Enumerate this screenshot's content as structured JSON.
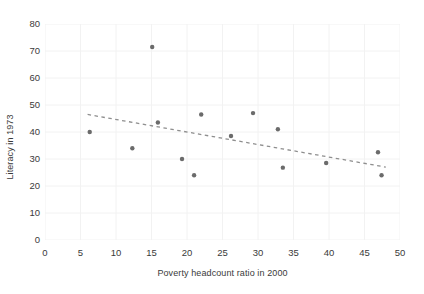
{
  "chart_data": {
    "type": "scatter",
    "title": "",
    "xlabel": "Poverty headcount ratio in 2000",
    "ylabel": "Literacy in 1973",
    "xlim": [
      0,
      50
    ],
    "ylim": [
      0,
      80
    ],
    "xticks": [
      0,
      5,
      10,
      15,
      20,
      25,
      30,
      35,
      40,
      45,
      50
    ],
    "yticks": [
      0,
      10,
      20,
      30,
      40,
      50,
      60,
      70,
      80
    ],
    "grid": true,
    "grid_color": "#f2f2f2",
    "legend": null,
    "marker_color": "#6b6b6b",
    "marker_size": 2.2,
    "points": [
      {
        "x": 6.3,
        "y": 40.0
      },
      {
        "x": 12.3,
        "y": 34.0
      },
      {
        "x": 15.1,
        "y": 71.5
      },
      {
        "x": 15.9,
        "y": 43.5
      },
      {
        "x": 19.3,
        "y": 30.0
      },
      {
        "x": 21.0,
        "y": 24.0
      },
      {
        "x": 22.0,
        "y": 46.5
      },
      {
        "x": 26.2,
        "y": 38.5
      },
      {
        "x": 29.3,
        "y": 47.0
      },
      {
        "x": 32.8,
        "y": 41.0
      },
      {
        "x": 33.5,
        "y": 26.8
      },
      {
        "x": 39.6,
        "y": 28.5
      },
      {
        "x": 46.9,
        "y": 32.5
      },
      {
        "x": 47.4,
        "y": 24.0
      }
    ],
    "trendline": {
      "style": "dashed",
      "color": "#8e8e8e",
      "x0": 6.0,
      "y0": 46.5,
      "x1": 48.0,
      "y1": 27.0
    }
  }
}
